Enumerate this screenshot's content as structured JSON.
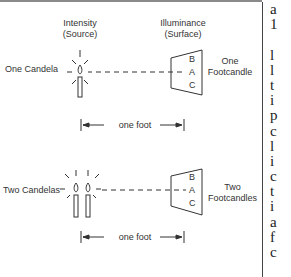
{
  "figure": {
    "header_source": {
      "line1": "Intensity",
      "line2": "(Source)"
    },
    "header_surface": {
      "line1": "Illuminance",
      "line2": "(Surface)"
    },
    "top_panel": {
      "source_label": "One Candela",
      "result_line1": "One",
      "result_line2": "Footcandle",
      "surface_points": [
        "B",
        "A",
        "C"
      ],
      "distance_label": "one foot"
    },
    "bottom_panel": {
      "source_label": "Two Candelas",
      "result_line1": "Two",
      "result_line2": "Footcandles",
      "surface_points": [
        "B",
        "A",
        "C"
      ],
      "distance_label": "one foot"
    }
  },
  "right_column_text": [
    "a",
    "1",
    "",
    "l",
    "l",
    "t",
    "i",
    "p",
    "c",
    "l",
    "i",
    "c",
    "t",
    "i",
    "a",
    "f",
    "c"
  ],
  "colors": {
    "line": "#333333",
    "rule": "#8a8a8a",
    "text": "#333333"
  }
}
